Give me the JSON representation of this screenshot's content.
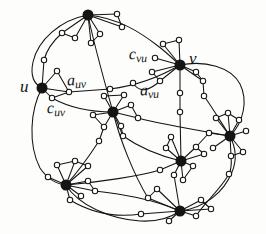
{
  "figure": {
    "background_color": "#fdfdfc",
    "ink_color": "#141414",
    "hub_fill": "#141414",
    "satellite_fill": "#ffffff",
    "satellite_stroke": "#141414",
    "width": 266,
    "height": 234
  },
  "labels": {
    "u": {
      "text": "u",
      "sub": ""
    },
    "v": {
      "text": "v",
      "sub": ""
    },
    "a_uv": {
      "text": "a",
      "sub": "uv"
    },
    "c_uv": {
      "text": "c",
      "sub": "uv"
    },
    "a_vu": {
      "text": "a",
      "sub": "vu"
    },
    "c_vu": {
      "text": "c",
      "sub": "vu"
    }
  },
  "chart_data": {
    "type": "diagram",
    "title": "",
    "hubs": [
      {
        "id": "top",
        "x": 88,
        "y": 15,
        "r": 5.5,
        "label": ""
      },
      {
        "id": "u",
        "x": 42,
        "y": 88,
        "r": 5.5,
        "label": "u"
      },
      {
        "id": "v",
        "x": 180,
        "y": 65,
        "r": 5.5,
        "label": "v"
      },
      {
        "id": "center",
        "x": 113,
        "y": 112,
        "r": 5.5,
        "label": ""
      },
      {
        "id": "right",
        "x": 230,
        "y": 136,
        "r": 5.5,
        "label": ""
      },
      {
        "id": "midlow",
        "x": 181,
        "y": 161,
        "r": 5.5,
        "label": ""
      },
      {
        "id": "botleft",
        "x": 66,
        "y": 185,
        "r": 5.5,
        "label": ""
      },
      {
        "id": "bottom",
        "x": 180,
        "y": 211,
        "r": 5.5,
        "label": ""
      }
    ],
    "satellites": [
      {
        "x": 117,
        "y": 14
      },
      {
        "x": 122,
        "y": 27
      },
      {
        "x": 62,
        "y": 33
      },
      {
        "x": 75,
        "y": 38
      },
      {
        "x": 91,
        "y": 43
      },
      {
        "x": 100,
        "y": 34
      },
      {
        "x": 44,
        "y": 60
      },
      {
        "x": 57,
        "y": 71
      },
      {
        "x": 52,
        "y": 98
      },
      {
        "x": 69,
        "y": 92
      },
      {
        "x": 110,
        "y": 89
      },
      {
        "x": 163,
        "y": 44
      },
      {
        "x": 179,
        "y": 40
      },
      {
        "x": 155,
        "y": 58
      },
      {
        "x": 152,
        "y": 72
      },
      {
        "x": 160,
        "y": 81
      },
      {
        "x": 196,
        "y": 72
      },
      {
        "x": 203,
        "y": 81
      },
      {
        "x": 180,
        "y": 93
      },
      {
        "x": 180,
        "y": 112
      },
      {
        "x": 104,
        "y": 96
      },
      {
        "x": 124,
        "y": 95
      },
      {
        "x": 93,
        "y": 115
      },
      {
        "x": 131,
        "y": 105
      },
      {
        "x": 138,
        "y": 118
      },
      {
        "x": 121,
        "y": 126
      },
      {
        "x": 104,
        "y": 127
      },
      {
        "x": 99,
        "y": 141
      },
      {
        "x": 123,
        "y": 136
      },
      {
        "x": 216,
        "y": 118
      },
      {
        "x": 228,
        "y": 113
      },
      {
        "x": 239,
        "y": 120
      },
      {
        "x": 209,
        "y": 133
      },
      {
        "x": 246,
        "y": 131
      },
      {
        "x": 213,
        "y": 148
      },
      {
        "x": 231,
        "y": 156
      },
      {
        "x": 243,
        "y": 152
      },
      {
        "x": 166,
        "y": 148
      },
      {
        "x": 171,
        "y": 137
      },
      {
        "x": 196,
        "y": 147
      },
      {
        "x": 204,
        "y": 154
      },
      {
        "x": 193,
        "y": 166
      },
      {
        "x": 174,
        "y": 175
      },
      {
        "x": 183,
        "y": 180
      },
      {
        "x": 160,
        "y": 170
      },
      {
        "x": 57,
        "y": 165
      },
      {
        "x": 75,
        "y": 161
      },
      {
        "x": 88,
        "y": 166
      },
      {
        "x": 48,
        "y": 177
      },
      {
        "x": 88,
        "y": 181
      },
      {
        "x": 95,
        "y": 191
      },
      {
        "x": 81,
        "y": 196
      },
      {
        "x": 70,
        "y": 200
      },
      {
        "x": 148,
        "y": 198
      },
      {
        "x": 157,
        "y": 189
      },
      {
        "x": 201,
        "y": 200
      },
      {
        "x": 211,
        "y": 209
      },
      {
        "x": 141,
        "y": 214
      },
      {
        "x": 169,
        "y": 221
      },
      {
        "x": 196,
        "y": 216
      },
      {
        "x": 133,
        "y": 83
      },
      {
        "x": 204,
        "y": 96
      },
      {
        "x": 229,
        "y": 174
      }
    ],
    "edge_count": 96,
    "hub_count": 8,
    "satellite_count": 63
  }
}
